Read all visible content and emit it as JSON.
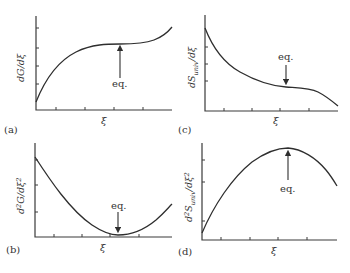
{
  "figure": {
    "panels": [
      {
        "id": "a",
        "label": "(a)",
        "ylabel": "dG/dξ",
        "xlabel": "ξ",
        "annotation": "eq.",
        "shape": "rising with inflection plateau at equilibrium"
      },
      {
        "id": "b",
        "label": "(b)",
        "ylabel": "d²G/dξ²",
        "xlabel": "ξ",
        "annotation": "eq.",
        "shape": "U-shaped minimum at equilibrium"
      },
      {
        "id": "c",
        "label": "(c)",
        "ylabel": "dS_univ/dξ",
        "xlabel": "ξ",
        "annotation": "eq.",
        "shape": "decaying with inflection plateau at equilibrium"
      },
      {
        "id": "d",
        "label": "(d)",
        "ylabel": "d²S_univ/dξ²",
        "xlabel": "ξ",
        "annotation": "eq.",
        "shape": "inverted-U maximum at equilibrium"
      }
    ],
    "colors": {
      "line": "#2e2e2e",
      "axis": "#3a3a3a",
      "text": "#333333",
      "background": "#ffffff"
    }
  },
  "labels": {
    "a": {
      "panel": "(a)",
      "y_main": "dG/dξ",
      "x": "ξ",
      "eq": "eq."
    },
    "b": {
      "panel": "(b)",
      "y_pre": "d",
      "y_sup1": "2",
      "y_mid": "G/dξ",
      "y_sup2": "2",
      "x": "ξ",
      "eq": "eq."
    },
    "c": {
      "panel": "(c)",
      "y_pre": "dS",
      "y_sub": "univ",
      "y_post": "/dξ",
      "x": "ξ",
      "eq": "eq."
    },
    "d": {
      "panel": "(d)",
      "y_pre": "d",
      "y_sup1": "2",
      "y_s": "S",
      "y_sub": "univ",
      "y_post": "/dξ",
      "y_sup2": "2",
      "x": "ξ",
      "eq": "eq."
    }
  }
}
